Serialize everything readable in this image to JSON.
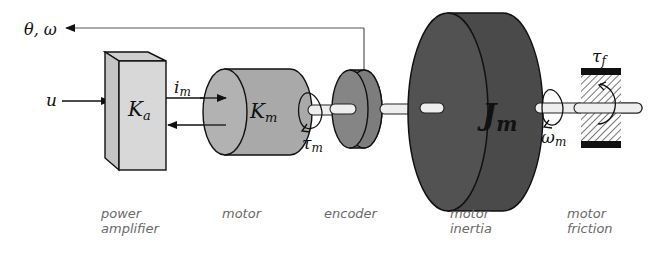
{
  "diagram": {
    "signals": {
      "feedback": "θ, ω",
      "input": "u",
      "current": "i",
      "current_sub": "m",
      "motor_torque": "τ",
      "motor_torque_sub": "m",
      "motor_speed": "ω",
      "motor_speed_sub": "m",
      "friction_torque": "τ",
      "friction_torque_sub": "f"
    },
    "blocks": {
      "amplifier": {
        "symbol": "K",
        "sub": "a",
        "caption_line1": "power",
        "caption_line2": "amplifier"
      },
      "motor": {
        "symbol": "K",
        "sub": "m",
        "caption_line1": "motor"
      },
      "encoder": {
        "caption_line1": "encoder"
      },
      "inertia": {
        "symbol": "J",
        "sub": "m",
        "caption_line1": "motor",
        "caption_line2": "inertia"
      },
      "friction": {
        "caption_line1": "motor",
        "caption_line2": "friction"
      }
    },
    "colors": {
      "amplifier": "#d6d6d6",
      "motor": "#a8a8a8",
      "encoder": "#7a7a7a",
      "inertia": "#4b4b4b",
      "shaft": "#eeeeee",
      "outline": "#111111"
    }
  }
}
